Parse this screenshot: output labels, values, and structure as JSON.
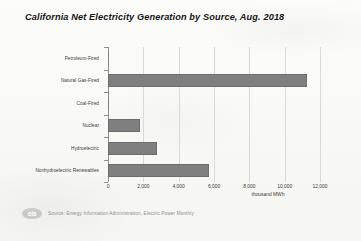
{
  "chart_data": {
    "type": "bar",
    "orientation": "horizontal",
    "title": "California Net Electricity Generation by Source, Aug. 2018",
    "xlabel": "thousand MWh",
    "ylabel": "",
    "categories": [
      "Petroleum-Fired",
      "Natural Gas-Fired",
      "Coal-Fired",
      "Nuclear",
      "Hydroelectric",
      "Nonhydroelectric Renewables"
    ],
    "values": [
      30,
      11250,
      45,
      1800,
      2800,
      5700
    ],
    "xlim": [
      0,
      12000
    ],
    "xticks": [
      0,
      2000,
      4000,
      6000,
      8000,
      10000,
      12000
    ],
    "xticklabels": [
      "0",
      "2,000",
      "4,000",
      "6,000",
      "8,000",
      "10,000",
      "12,000"
    ],
    "grid": true,
    "legend": false,
    "bar_color": "#7f7f7f",
    "background_color": "#fbfbf9"
  },
  "footer": {
    "logo_text": "eia",
    "source": "Source: Energy Information Administration, Electric Power Monthly"
  }
}
